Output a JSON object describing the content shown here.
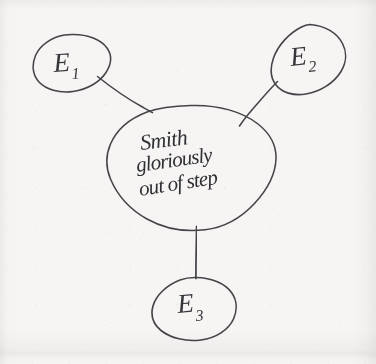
{
  "diagram": {
    "type": "hand-drawn-mind-map",
    "medium": "pen on paper",
    "ink_color": "#35353a",
    "paper_color": "#f6f5f3",
    "center_node": {
      "name": "center-node",
      "shape": "irregular-ellipse",
      "text_lines": [
        "Smith",
        "gloriously",
        "out of step"
      ],
      "text_full": "Smith gloriously out of step"
    },
    "satellite_nodes": [
      {
        "id": "e1",
        "label": "E",
        "subscript": "1",
        "label_full": "E1",
        "position": "top-left"
      },
      {
        "id": "e2",
        "label": "E",
        "subscript": "2",
        "label_full": "E2",
        "position": "top-right"
      },
      {
        "id": "e3",
        "label": "E",
        "subscript": "3",
        "label_full": "E3",
        "position": "bottom-center"
      }
    ],
    "connectors": [
      {
        "id": "edge-center-e1",
        "from": "center-node",
        "to": "e1"
      },
      {
        "id": "edge-center-e2",
        "from": "center-node",
        "to": "e2"
      },
      {
        "id": "edge-center-e3",
        "from": "center-node",
        "to": "e3"
      }
    ]
  }
}
